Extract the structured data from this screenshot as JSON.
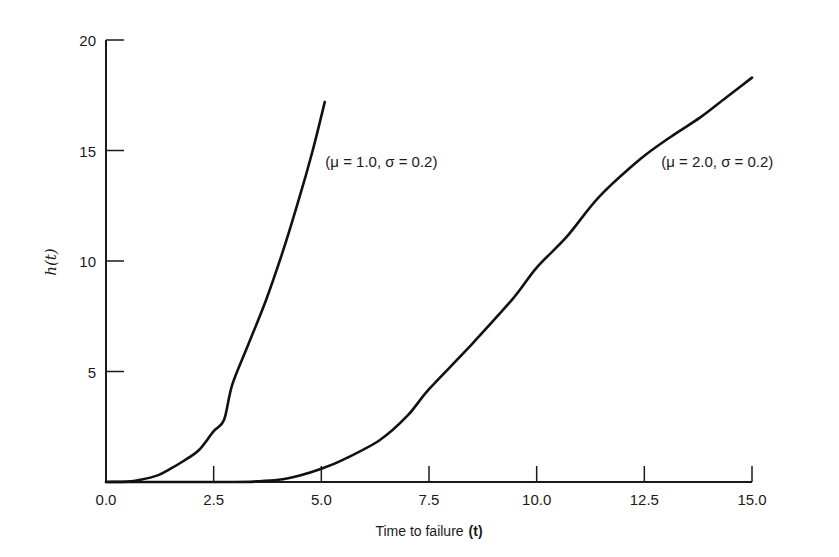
{
  "chart_data": {
    "type": "line",
    "title": "",
    "xlabel": "Time to failure (t)",
    "xlabel_parts": {
      "text": "Time to failure",
      "var": "(t)"
    },
    "ylabel": "h(t)",
    "xlim": [
      0,
      15
    ],
    "ylim": [
      0,
      20
    ],
    "x_ticks": [
      0,
      2.5,
      5,
      7.5,
      10,
      12.5,
      15
    ],
    "x_tick_labels": [
      "0.0",
      "2.5",
      "5.0",
      "7.5",
      "10.0",
      "12.5",
      "15.0"
    ],
    "y_ticks": [
      5,
      10,
      15,
      20
    ],
    "y_tick_labels": [
      "5",
      "10",
      "15",
      "20"
    ],
    "grid": false,
    "legend": "inline annotations",
    "series": [
      {
        "name": "(μ = 1.0, σ = 0.2)",
        "label_at": {
          "x": 5.0,
          "y": 14.5
        },
        "x": [
          0,
          0.5,
          0.8,
          1.2,
          1.5,
          1.8,
          2.16,
          2.5,
          2.74,
          2.93,
          3.3,
          3.71,
          4.1,
          4.48,
          4.8,
          5.08
        ],
        "y": [
          0,
          0.02,
          0.1,
          0.3,
          0.6,
          0.95,
          1.45,
          2.3,
          2.8,
          4.4,
          6.2,
          8.2,
          10.4,
          12.8,
          15.0,
          17.2
        ]
      },
      {
        "name": "(μ = 2.0, σ = 0.2)",
        "label_at": {
          "x": 12.8,
          "y": 14.5
        },
        "x": [
          0,
          3.0,
          3.5,
          4.0,
          4.5,
          5.0,
          5.5,
          6.36,
          7.0,
          7.5,
          8.43,
          9.45,
          10.0,
          10.7,
          11.45,
          12.4,
          13.1,
          13.8,
          14.4,
          15.0
        ],
        "y": [
          0,
          0,
          0.03,
          0.1,
          0.3,
          0.6,
          1.0,
          1.9,
          3.0,
          4.2,
          6.1,
          8.3,
          9.7,
          11.1,
          12.9,
          14.6,
          15.6,
          16.5,
          17.4,
          18.3
        ]
      }
    ]
  }
}
